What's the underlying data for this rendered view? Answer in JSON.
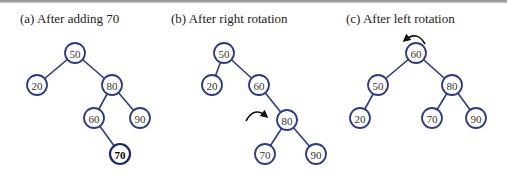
{
  "panels": [
    {
      "id": "a",
      "caption": "(a) After adding 70",
      "caption_x": 20,
      "nodes": [
        {
          "label": "50",
          "x": 75,
          "y": 53
        },
        {
          "label": "20",
          "x": 37,
          "y": 85
        },
        {
          "label": "80",
          "x": 112,
          "y": 85
        },
        {
          "label": "60",
          "x": 94,
          "y": 118
        },
        {
          "label": "90",
          "x": 140,
          "y": 118
        },
        {
          "label": "70",
          "x": 120,
          "y": 154,
          "bold": true
        }
      ],
      "edges": [
        [
          "50",
          "20"
        ],
        [
          "50",
          "80"
        ],
        [
          "80",
          "60"
        ],
        [
          "80",
          "90"
        ],
        [
          "60",
          "70"
        ]
      ]
    },
    {
      "id": "b",
      "caption": "(b) After right rotation",
      "caption_x": 171,
      "nodes": [
        {
          "label": "50",
          "x": 224,
          "y": 53
        },
        {
          "label": "20",
          "x": 212,
          "y": 85
        },
        {
          "label": "60",
          "x": 259,
          "y": 85
        },
        {
          "label": "80",
          "x": 287,
          "y": 120
        },
        {
          "label": "70",
          "x": 265,
          "y": 154
        },
        {
          "label": "90",
          "x": 316,
          "y": 154
        }
      ],
      "edges": [
        [
          "50",
          "20"
        ],
        [
          "50",
          "60"
        ],
        [
          "60",
          "80"
        ],
        [
          "80",
          "70"
        ],
        [
          "80",
          "90"
        ]
      ],
      "rotation_arrow": {
        "direction": "clockwise",
        "near_node": "80"
      }
    },
    {
      "id": "c",
      "caption": "(c) After left rotation",
      "caption_x": 346,
      "nodes": [
        {
          "label": "60",
          "x": 416,
          "y": 53
        },
        {
          "label": "50",
          "x": 378,
          "y": 85
        },
        {
          "label": "80",
          "x": 452,
          "y": 85
        },
        {
          "label": "20",
          "x": 360,
          "y": 118
        },
        {
          "label": "70",
          "x": 432,
          "y": 118
        },
        {
          "label": "90",
          "x": 476,
          "y": 118
        }
      ],
      "edges": [
        [
          "60",
          "50"
        ],
        [
          "60",
          "80"
        ],
        [
          "50",
          "20"
        ],
        [
          "80",
          "70"
        ],
        [
          "80",
          "90"
        ]
      ],
      "rotation_arrow": {
        "direction": "counterclockwise",
        "near_node": "60"
      }
    }
  ],
  "colors": {
    "node_stroke": "#2b3a8c",
    "edge": "#2b3a8c",
    "arrow": "#111111",
    "text": "#333333"
  }
}
